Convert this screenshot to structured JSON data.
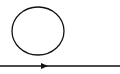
{
  "diagram": {
    "type": "circle-above-directed-line",
    "stroke_color": "#111111",
    "background": "#ffffff",
    "elements": [
      {
        "kind": "circle",
        "cx": 38,
        "cy": 31,
        "rx": 26,
        "ry": 24
      },
      {
        "kind": "directed-line",
        "x1": 0,
        "y1": 66,
        "x2": 120,
        "y2": 66,
        "arrow_at_x": 47,
        "direction": "right"
      }
    ]
  }
}
